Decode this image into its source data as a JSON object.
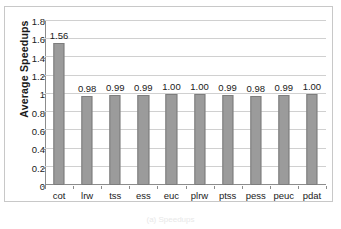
{
  "chart_data": {
    "type": "bar",
    "title": "",
    "xlabel": "",
    "ylabel": "Average Speedups",
    "categories": [
      "cot",
      "lrw",
      "tss",
      "ess",
      "euc",
      "plrw",
      "ptss",
      "pess",
      "peuc",
      "pdat"
    ],
    "values": [
      1.56,
      0.98,
      0.99,
      0.99,
      1.0,
      1.0,
      0.99,
      0.98,
      0.99,
      1.0
    ],
    "value_labels": [
      "1.56",
      "0.98",
      "0.99",
      "0.99",
      "1.00",
      "1.00",
      "0.99",
      "0.98",
      "0.99",
      "1.00"
    ],
    "ylim": [
      0,
      1.8
    ],
    "ytick_values": [
      0,
      0.2,
      0.4,
      0.6,
      0.8,
      1.0,
      1.2,
      1.4,
      1.6,
      1.8
    ],
    "ytick_labels": [
      "0",
      "0.2",
      "0.4",
      "0.6",
      "0.8",
      "1",
      "1.2",
      "1.4",
      "1.6",
      "1.8"
    ],
    "grid": "horizontal",
    "legend": "none",
    "bar_color": "#9b9b9b",
    "bar_border_color": "#7d7d7d",
    "gridline_color": "#d0d0d0",
    "axis_color": "#8c8c8c"
  },
  "caption": {
    "text": "(a) Speedups"
  }
}
